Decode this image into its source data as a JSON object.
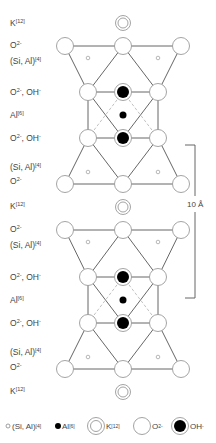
{
  "diagram": {
    "type": "mica crystal structure (layered silicate)",
    "labels_left": [
      {
        "id": "k-top",
        "main": "K",
        "sup": "[12]",
        "y": 18
      },
      {
        "id": "o2-top",
        "main": "O",
        "sup": "2-",
        "y": 40
      },
      {
        "id": "siai-top",
        "main": "(Si, Al)",
        "sup": "[4]",
        "y": 56
      },
      {
        "id": "ooh-1",
        "main": "O",
        "sup": "2-",
        "suffix": ", OH",
        "sup2": "-",
        "y": 87
      },
      {
        "id": "al-1",
        "main": "Al",
        "sup": "[6]",
        "y": 110
      },
      {
        "id": "ooh-2",
        "main": "O",
        "sup": "2-",
        "suffix": ", OH",
        "sup2": "-",
        "y": 133
      },
      {
        "id": "siai-2",
        "main": "(Si, Al)",
        "sup": "[4]",
        "y": 162
      },
      {
        "id": "o2-2",
        "main": "O",
        "sup": "2-",
        "y": 176
      },
      {
        "id": "k-mid",
        "main": "K",
        "sup": "[12]",
        "y": 201
      },
      {
        "id": "o2-3",
        "main": "O",
        "sup": "2-",
        "y": 224
      },
      {
        "id": "siai-3",
        "main": "(Si, Al)",
        "sup": "[4]",
        "y": 240
      },
      {
        "id": "ooh-3",
        "main": "O",
        "sup": "2-",
        "suffix": ", OH",
        "sup2": "-",
        "y": 272
      },
      {
        "id": "al-2",
        "main": "Al",
        "sup": "[6]",
        "y": 295
      },
      {
        "id": "ooh-4",
        "main": "O",
        "sup": "2-",
        "suffix": ", OH",
        "sup2": "-",
        "y": 318
      },
      {
        "id": "siai-4",
        "main": "(Si, Al)",
        "sup": "[4]",
        "y": 347
      },
      {
        "id": "o2-4",
        "main": "O",
        "sup": "2-",
        "y": 362
      },
      {
        "id": "k-bot",
        "main": "K",
        "sup": "[12]",
        "y": 386
      }
    ],
    "scale_bar": {
      "label": "10 Å",
      "from_y": 145,
      "to_y": 298
    },
    "legend": [
      {
        "symbol": "small-open-circle",
        "main": "(Si, Al)",
        "sup": "[4]"
      },
      {
        "symbol": "small-filled-circle",
        "main": "Al",
        "sup": "[6]"
      },
      {
        "symbol": "double-ring",
        "main": "K",
        "sup": "[12]"
      },
      {
        "symbol": "large-open-circle",
        "main": "O",
        "sup": "2-"
      },
      {
        "symbol": "large-filled-ringed-circle",
        "main": "OH",
        "sup": "-"
      }
    ],
    "colors": {
      "stroke": "#555555",
      "atom_fill": "#ffffff",
      "atom_stroke": "#9a9a9a",
      "filled": "#000000",
      "dashed": "#b8b8b8"
    }
  }
}
